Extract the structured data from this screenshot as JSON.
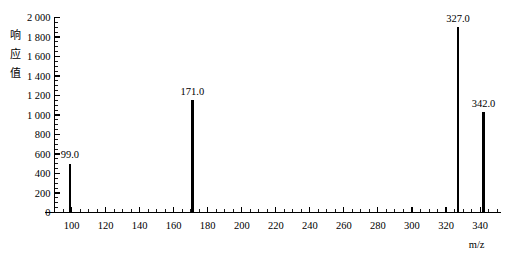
{
  "chart_data": {
    "type": "bar",
    "title": "",
    "subtitle": "",
    "xlabel": "m/z",
    "ylabel": "响应值",
    "ylabel_chars": [
      "响",
      "应",
      "值"
    ],
    "xlim": [
      90,
      352
    ],
    "ylim": [
      0,
      2000
    ],
    "grid": false,
    "legend": null,
    "x_major_step": 20,
    "x_minor_step": 5,
    "y_major_step": 200,
    "y_minor_step": 50,
    "x_tick_labels": [
      "100",
      "120",
      "140",
      "160",
      "180",
      "200",
      "220",
      "240",
      "260",
      "280",
      "300",
      "320",
      "340"
    ],
    "x_tick_values": [
      100,
      120,
      140,
      160,
      180,
      200,
      220,
      240,
      260,
      280,
      300,
      320,
      340
    ],
    "y_tick_labels": [
      "0",
      "200",
      "400",
      "600",
      "800",
      "1 000",
      "1 200",
      "1 400",
      "1 600",
      "1 800",
      "2 000"
    ],
    "y_tick_values": [
      0,
      200,
      400,
      600,
      800,
      1000,
      1200,
      1400,
      1600,
      1800,
      2000
    ],
    "x": [
      99.0,
      171.0,
      327.0,
      342.0
    ],
    "values": [
      500,
      1150,
      1900,
      1030
    ],
    "categories": [
      "99.0",
      "171.0",
      "327.0",
      "342.0"
    ],
    "annotations": [
      {
        "label": "99.0",
        "x": 99.0,
        "y": 500
      },
      {
        "label": "171.0",
        "x": 171.0,
        "y": 1150
      },
      {
        "label": "327.0",
        "x": 327.0,
        "y": 1900
      },
      {
        "label": "342.0",
        "x": 342.0,
        "y": 1030
      }
    ],
    "series_color": "#000000",
    "axis_color": "#000000",
    "background_color": "#ffffff"
  }
}
